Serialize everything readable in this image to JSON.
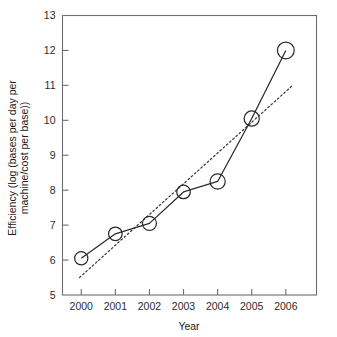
{
  "chart_data": {
    "type": "line",
    "title": "",
    "xlabel": "Year",
    "ylabel": "Efficiency (log (bases per day per machine/cost per base))",
    "ylabel_line1": "Efficiency (log (bases per day per",
    "ylabel_line2": "machine/cost per base))",
    "categories": [
      "2000",
      "2001",
      "2002",
      "2003",
      "2004",
      "2005",
      "2006"
    ],
    "x": [
      2000,
      2001,
      2002,
      2003,
      2004,
      2005,
      2006
    ],
    "xlim": [
      1999.45,
      2006.9
    ],
    "ylim": [
      5,
      13
    ],
    "yticks": [
      5,
      6,
      7,
      8,
      9,
      10,
      11,
      12,
      13
    ],
    "ytick_labels": [
      "5",
      "6",
      "7",
      "8",
      "9",
      "10",
      "11",
      "12",
      "13"
    ],
    "xticks": [
      2000,
      2001,
      2002,
      2003,
      2004,
      2005,
      2006
    ],
    "grid": false,
    "legend": "none",
    "series": [
      {
        "name": "Efficiency",
        "style": "solid-line-open-circle-markers",
        "marker": "open-circle",
        "color": "#2b2b2b",
        "values": [
          6.05,
          6.75,
          7.05,
          7.95,
          8.25,
          10.05,
          12.0
        ]
      },
      {
        "name": "Trend (fitted)",
        "style": "dotted-line",
        "marker": "none",
        "color": "#3a3a3a",
        "endpoints": [
          {
            "x": 1999.95,
            "y": 5.5
          },
          {
            "x": 2006.2,
            "y": 11.0
          }
        ]
      }
    ]
  },
  "colors": {
    "axis": "#6e6e6e",
    "data": "#2b2b2b",
    "trend": "#3a3a3a",
    "background": "#ffffff",
    "text": "#1a1a1a"
  }
}
